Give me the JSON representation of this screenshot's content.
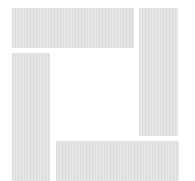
{
  "figure": {
    "fill_color": "#e3e3e3",
    "background_color": "#ffffff",
    "bars": [
      {
        "name": "top-bar",
        "x": 12,
        "y": 8,
        "w": 122,
        "h": 40
      },
      {
        "name": "right-bar",
        "x": 139,
        "y": 8,
        "w": 39,
        "h": 128
      },
      {
        "name": "left-bar",
        "x": 12,
        "y": 53,
        "w": 38,
        "h": 128
      },
      {
        "name": "bottom-bar",
        "x": 56,
        "y": 141,
        "w": 123,
        "h": 40
      }
    ]
  }
}
